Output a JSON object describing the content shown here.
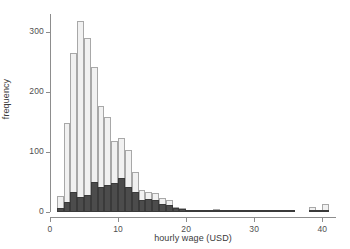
{
  "chart_data": {
    "type": "bar",
    "title": "",
    "subtitle": "",
    "xlabel": "hourly wage (USD)",
    "ylabel": "frequency",
    "xlim": [
      0,
      42
    ],
    "ylim": [
      0,
      330
    ],
    "grid": false,
    "legend": null,
    "bin_width": 1,
    "xticks": [
      0,
      10,
      20,
      30,
      40
    ],
    "xtick_labels": [
      "0",
      "10",
      "20",
      "30",
      "40"
    ],
    "yticks": [
      0,
      100,
      200,
      300
    ],
    "ytick_labels": [
      "0",
      "100",
      "200",
      "300"
    ],
    "bin_centers": [
      1.5,
      2.5,
      3.5,
      4.5,
      5.5,
      6.5,
      7.5,
      8.5,
      9.5,
      10.5,
      11.5,
      12.5,
      13.5,
      14.5,
      15.5,
      16.5,
      17.5,
      18.5,
      19.5,
      20.5,
      21.5,
      22.5,
      23.5,
      24.5,
      25.5,
      26.5,
      27.5,
      28.5,
      29.5,
      30.5,
      31.5,
      32.5,
      33.5,
      34.5,
      35.5,
      36.5,
      37.5,
      38.5,
      39.5,
      40.5
    ],
    "series": [
      {
        "name": "total",
        "style": "light-outlined",
        "color": "#f1f1f1",
        "edge_color": "#a8a8a8",
        "values": [
          27,
          148,
          265,
          318,
          290,
          242,
          177,
          158,
          119,
          123,
          104,
          66,
          37,
          34,
          31,
          23,
          20,
          9,
          7,
          4,
          3,
          3,
          3,
          5,
          3,
          2,
          3,
          3,
          4,
          3,
          1,
          1,
          1,
          4,
          1,
          0,
          0,
          9,
          2,
          14
        ]
      },
      {
        "name": "subgroup",
        "style": "dark-filled",
        "color": "#4c4c4c",
        "edge_color": "#3a3a3a",
        "values": [
          6,
          16,
          33,
          25,
          29,
          50,
          41,
          45,
          48,
          57,
          42,
          33,
          20,
          21,
          20,
          13,
          11,
          6,
          5,
          3,
          2,
          2,
          2,
          2,
          2,
          1,
          2,
          2,
          3,
          3,
          1,
          1,
          1,
          3,
          1,
          0,
          0,
          3,
          1,
          3
        ]
      }
    ]
  }
}
